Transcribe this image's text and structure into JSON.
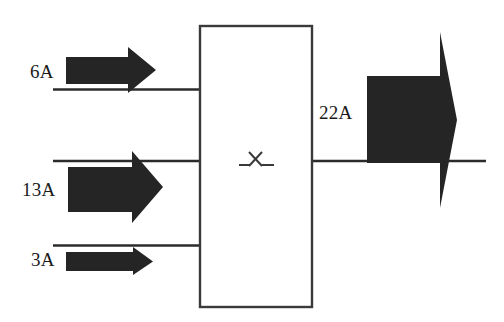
{
  "diagram": {
    "type": "block-flow-diagram",
    "colors": {
      "arrow_fill": "#252525",
      "line_stroke": "#2b2b2b",
      "box_stroke": "#3a3a3a",
      "box_fill": "#ffffff",
      "text": "#1a1a1a",
      "background": "#ffffff"
    },
    "process_box": {
      "name": "process-unit",
      "marker": "X",
      "x": 199,
      "y": 25,
      "width": 114,
      "height": 283
    },
    "inputs": [
      {
        "id": "input-6a",
        "label": "6A",
        "value": 6,
        "unit": "A",
        "line_y": 89,
        "arrow_size": "medium"
      },
      {
        "id": "input-13a",
        "label": "13A",
        "value": 13,
        "unit": "A",
        "line_y": 161,
        "arrow_size": "large"
      },
      {
        "id": "input-3a",
        "label": "3A",
        "value": 3,
        "unit": "A",
        "line_y": 245,
        "arrow_size": "small"
      }
    ],
    "outputs": [
      {
        "id": "output-22a",
        "label": "22A",
        "value": 22,
        "unit": "A",
        "line_y": 161,
        "arrow_size": "extra-large"
      }
    ]
  }
}
